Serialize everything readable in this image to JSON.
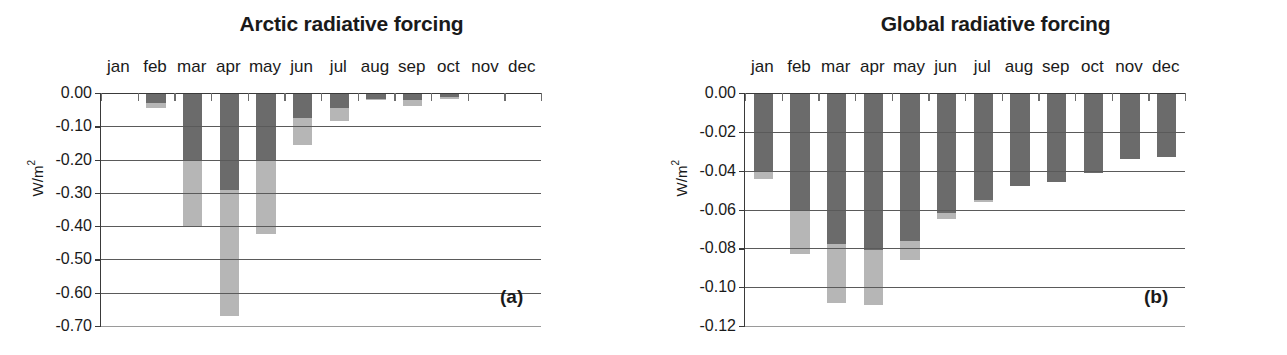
{
  "figure": {
    "panels": [
      {
        "id": "a",
        "tag": "(a)",
        "title": "Arctic radiative forcing",
        "ylabel_main": "W/m",
        "ylabel_sup": "2"
      },
      {
        "id": "b",
        "tag": "(b)",
        "title": "Global radiative forcing",
        "ylabel_main": "W/m",
        "ylabel_sup": "2"
      }
    ]
  },
  "chart_data": [
    {
      "type": "bar",
      "panel": "a",
      "panel_label": "(a)",
      "title": "Arctic radiative forcing",
      "xlabel": "",
      "ylabel": "W/m2",
      "ylim": [
        -0.7,
        0.0
      ],
      "yticks": [
        "0.00",
        "-0.10",
        "-0.20",
        "-0.30",
        "-0.40",
        "-0.50",
        "-0.60",
        "-0.70"
      ],
      "ytick_values": [
        0.0,
        -0.1,
        -0.2,
        -0.3,
        -0.4,
        -0.5,
        -0.6,
        -0.7
      ],
      "grid": true,
      "legend": "none",
      "stacked": true,
      "categories": [
        "jan",
        "feb",
        "mar",
        "apr",
        "may",
        "jun",
        "jul",
        "aug",
        "sep",
        "oct",
        "nov",
        "dec"
      ],
      "series": [
        {
          "name": "dark-segment",
          "color": "#6b6b6b",
          "values": [
            0.0,
            -0.03,
            -0.205,
            -0.29,
            -0.2,
            -0.075,
            -0.045,
            -0.018,
            -0.022,
            -0.013,
            0.0,
            0.0
          ]
        },
        {
          "name": "light-segment",
          "color": "#b6b6b6",
          "values": [
            0.0,
            -0.045,
            -0.4,
            -0.67,
            -0.425,
            -0.155,
            -0.085,
            -0.022,
            -0.038,
            -0.017,
            0.0,
            0.0
          ]
        }
      ]
    },
    {
      "type": "bar",
      "panel": "b",
      "panel_label": "(b)",
      "title": "Global radiative forcing",
      "xlabel": "",
      "ylabel": "W/m2",
      "ylim": [
        -0.12,
        0.0
      ],
      "yticks": [
        "0.00",
        "-0.02",
        "-0.04",
        "-0.06",
        "-0.08",
        "-0.10",
        "-0.12"
      ],
      "ytick_values": [
        0.0,
        -0.02,
        -0.04,
        -0.06,
        -0.08,
        -0.1,
        -0.12
      ],
      "grid": true,
      "legend": "none",
      "stacked": true,
      "categories": [
        "jan",
        "feb",
        "mar",
        "apr",
        "may",
        "jun",
        "jul",
        "aug",
        "sep",
        "oct",
        "nov",
        "dec"
      ],
      "series": [
        {
          "name": "dark-segment",
          "color": "#6b6b6b",
          "values": [
            -0.04,
            -0.06,
            -0.078,
            -0.081,
            -0.076,
            -0.062,
            -0.055,
            -0.048,
            -0.046,
            -0.041,
            -0.034,
            -0.033
          ]
        },
        {
          "name": "light-segment",
          "color": "#b6b6b6",
          "values": [
            -0.0445,
            -0.083,
            -0.108,
            -0.109,
            -0.086,
            -0.065,
            -0.056,
            -0.048,
            -0.046,
            -0.041,
            -0.034,
            -0.033
          ]
        }
      ]
    }
  ]
}
